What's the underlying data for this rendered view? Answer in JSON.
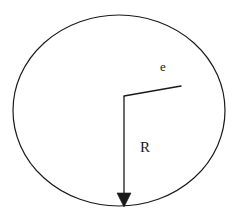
{
  "figure": {
    "background_color": "#ffffff",
    "stroke_color": "#1a1a1a",
    "stroke_width": 1.2,
    "width": 239,
    "height": 219,
    "labels": {
      "eccentricity": "e",
      "radius": "R"
    },
    "shapes": {
      "circle": {
        "name": "outer-circle",
        "center_x": 119,
        "center_y": 110.5,
        "radius_x": 106,
        "radius_y": 95.5
      },
      "radius_arrow": {
        "name": "radius-arrow",
        "start_x": 124,
        "start_y": 96,
        "end_x": 124,
        "end_y": 206,
        "arrowhead_width": 14,
        "arrowhead_height": 14
      },
      "offset_line": {
        "name": "eccentricity-line",
        "start_x": 124,
        "start_y": 96,
        "end_x": 181,
        "end_y": 86
      }
    },
    "label_positions": {
      "e": {
        "x": 160,
        "y": 60
      },
      "R": {
        "x": 140,
        "y": 140
      }
    }
  }
}
